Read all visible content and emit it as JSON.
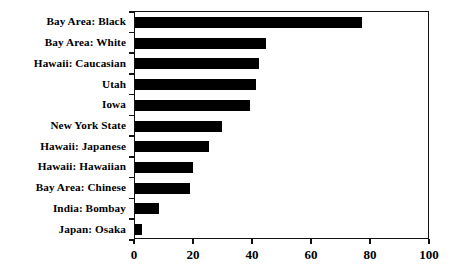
{
  "chart_data": {
    "type": "bar",
    "orientation": "horizontal",
    "title": "",
    "subtitle": "",
    "xlabel": "",
    "ylabel": "",
    "xlim": [
      0,
      100
    ],
    "xticks": [
      0,
      20,
      40,
      60,
      80,
      100
    ],
    "xtick_labels": [
      "0",
      "20",
      "40",
      "60",
      "80",
      "100"
    ],
    "grid": false,
    "legend": null,
    "bar_color": "#000000",
    "axis_color": "#111111",
    "background_color": "#ffffff",
    "categories": [
      "Bay Area: Black",
      "Bay Area: White",
      "Hawaii: Caucasian",
      "Utah",
      "Iowa",
      "New York State",
      "Hawaii: Japanese",
      "Hawaii: Hawaiian",
      "Bay Area: Chinese",
      "India: Bombay",
      "Japan: Osaka"
    ],
    "values": [
      77,
      44.5,
      42,
      41,
      39,
      29.5,
      25,
      19.5,
      18.5,
      8,
      2.5
    ]
  }
}
